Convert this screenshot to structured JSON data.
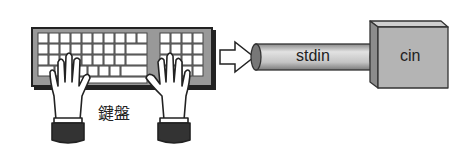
{
  "diagram": {
    "keyboard_label": "鍵盤",
    "pipe_label": "stdin",
    "box_label": "cin",
    "nodes": [
      {
        "id": "keyboard",
        "label": "鍵盤",
        "type": "keyboard-with-hands"
      },
      {
        "id": "stdin",
        "label": "stdin",
        "type": "cylinder-pipe"
      },
      {
        "id": "cin",
        "label": "cin",
        "type": "3d-box"
      }
    ],
    "edges": [
      {
        "from": "keyboard",
        "to": "stdin",
        "style": "hollow-arrow"
      },
      {
        "from": "stdin",
        "to": "cin",
        "style": "connected"
      }
    ],
    "colors": {
      "outline": "#222222",
      "gray": "#a8a8a8",
      "box_face": "#b4b4b4"
    }
  }
}
